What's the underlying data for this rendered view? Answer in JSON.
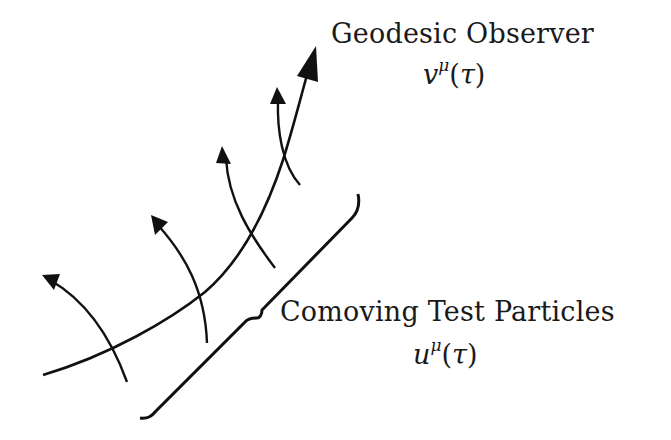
{
  "diagram": {
    "observer": {
      "label": "Geodesic Observer",
      "symbol_base": "v",
      "symbol_sup": "μ",
      "symbol_arg": "τ",
      "symbol_full": "v^μ(τ)"
    },
    "particles": {
      "label": "Comoving Test Particles",
      "symbol_base": "u",
      "symbol_sup": "μ",
      "symbol_arg": "τ",
      "symbol_full": "u^μ(τ)"
    },
    "elements": {
      "geodesic_worldline": "thick curve with large arrowhead pointing up-right",
      "particle_worldlines_count": 4,
      "brace": "curly brace grouping the particle worldlines"
    },
    "colors": {
      "stroke": "#111111",
      "background": "#ffffff"
    }
  }
}
